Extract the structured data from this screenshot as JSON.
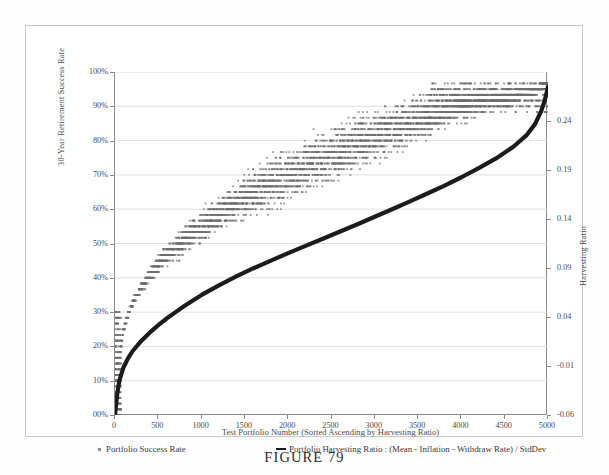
{
  "figure": {
    "caption": "FIGURE 79"
  },
  "chart_data": {
    "type": "scatter",
    "title": "",
    "xlabel": "Test Portfolio Number (Sorted Ascending by Harvesting Ratio)",
    "ylabel": "30-Year Retirement Success Rate",
    "y2label": "Harvesting Ratio",
    "xlim": [
      0,
      5000
    ],
    "xticks": [
      0,
      500,
      1000,
      1500,
      2000,
      2500,
      3000,
      3500,
      4000,
      4500,
      5000
    ],
    "xticklabels": [
      "0",
      "500",
      "1000",
      "1500",
      "2000",
      "2500",
      "3000",
      "3500",
      "4000",
      "4500",
      "5000"
    ],
    "ylim": [
      0,
      1.0
    ],
    "yticks": [
      0,
      0.1,
      0.2,
      0.3,
      0.4,
      0.5,
      0.6,
      0.7,
      0.8,
      0.9,
      1.0
    ],
    "yticklabels": [
      "00%",
      "10%",
      "20%",
      "30%",
      "40%",
      "50%",
      "60%",
      "70%",
      "80%",
      "90%",
      "100%"
    ],
    "y2lim": [
      -0.06,
      0.29
    ],
    "y2ticks": [
      -0.06,
      -0.01,
      0.04,
      0.09,
      0.14,
      0.19,
      0.24
    ],
    "y2ticklabels": [
      "-0.06",
      "-0.01",
      "0.04",
      "0.09",
      "0.14",
      "0.19",
      "0.24"
    ],
    "grid": true,
    "grid_color": "#d8d8d8",
    "legend_position": "bottom",
    "series": [
      {
        "name": "Portfolio Success Rate",
        "type": "scatter",
        "marker": "square",
        "color": "#6e6e6e",
        "axis": "left",
        "description": "Dense cloud of 5000 quantized success-rate points rising monotonically in banded clusters from about 0% at portfolio 0 to about 96% near portfolio 5000",
        "band_centers_x": [
          30,
          90,
          160,
          230,
          300,
          380,
          470,
          560,
          660,
          770,
          880,
          1000,
          1120,
          1250,
          1390,
          1530,
          1680,
          1840,
          2000,
          2170,
          2340,
          2520,
          2700,
          2890,
          3080,
          3280,
          3480,
          3690,
          3900,
          4120,
          4340,
          4570,
          4790,
          4950
        ],
        "band_centers_y": [
          0.1,
          0.24,
          0.3,
          0.34,
          0.37,
          0.4,
          0.43,
          0.46,
          0.48,
          0.5,
          0.53,
          0.55,
          0.57,
          0.59,
          0.62,
          0.64,
          0.66,
          0.68,
          0.7,
          0.72,
          0.74,
          0.76,
          0.78,
          0.8,
          0.82,
          0.84,
          0.86,
          0.88,
          0.9,
          0.91,
          0.92,
          0.93,
          0.94,
          0.96
        ]
      },
      {
        "name": "Portfolio Harvesting Ratio :  (Mean - Inflation - Withdraw Rate) / StdDev",
        "type": "line",
        "color": "#1c1c1c",
        "axis": "right",
        "description": "Thick black monotonically increasing curve, steep at both ends, nearly linear through the middle",
        "x": [
          0,
          25,
          50,
          100,
          150,
          200,
          300,
          400,
          500,
          600,
          700,
          800,
          900,
          1000,
          1200,
          1400,
          1600,
          1800,
          2000,
          2200,
          2400,
          2600,
          2800,
          3000,
          3200,
          3400,
          3600,
          3800,
          4000,
          4200,
          4400,
          4600,
          4750,
          4850,
          4920,
          4960,
          4985,
          5000
        ],
        "y_left_equiv": [
          0.0,
          0.06,
          0.1,
          0.14,
          0.165,
          0.185,
          0.215,
          0.24,
          0.262,
          0.282,
          0.3,
          0.318,
          0.334,
          0.35,
          0.378,
          0.404,
          0.428,
          0.45,
          0.472,
          0.493,
          0.514,
          0.535,
          0.556,
          0.578,
          0.6,
          0.622,
          0.645,
          0.668,
          0.693,
          0.72,
          0.748,
          0.782,
          0.815,
          0.848,
          0.885,
          0.915,
          0.94,
          0.957
        ],
        "y": [
          -0.06,
          -0.039,
          -0.025,
          -0.011,
          -0.0022,
          0.0048,
          0.0153,
          0.024,
          0.0317,
          0.0387,
          0.045,
          0.0513,
          0.0569,
          0.0625,
          0.0723,
          0.0814,
          0.0898,
          0.0975,
          0.1052,
          0.1126,
          0.1199,
          0.1273,
          0.1346,
          0.1423,
          0.15,
          0.1577,
          0.1658,
          0.1738,
          0.1826,
          0.192,
          0.2018,
          0.2137,
          0.2253,
          0.2368,
          0.2498,
          0.2603,
          0.269,
          0.275
        ]
      }
    ]
  },
  "axes": {
    "y_left_title": "30-Year Retirement Success Rate",
    "y_right_title": "Harvesting Ratio",
    "x_title": "Test Portfolio Number (Sorted Ascending by Harvesting Ratio)"
  },
  "legend": {
    "scatter_label": "Portfolio Success Rate",
    "line_label": "Portfolio Harvesting Ratio :  (Mean - Inflation - Withdraw Rate) / StdDev"
  }
}
